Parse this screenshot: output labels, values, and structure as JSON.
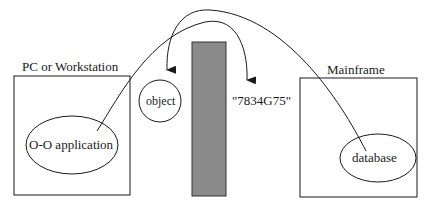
{
  "diagram": {
    "left_box": {
      "label": "PC or Workstation",
      "inner": "O-O application"
    },
    "right_box": {
      "label": "Mainframe",
      "inner": "database"
    },
    "object_label": "object",
    "value_label": "\"7834G75\"",
    "colors": {
      "stroke": "#1a1a1a",
      "barrier_fill": "#8a8a8a",
      "barrier_stroke": "#333333"
    }
  }
}
